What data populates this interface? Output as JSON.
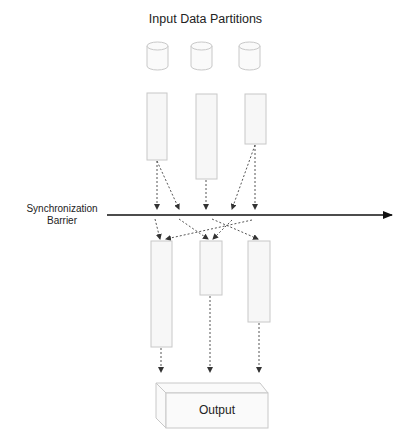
{
  "diagram": {
    "title": "Input Data Partitions",
    "barrier_label_line1": "Synchronization",
    "barrier_label_line2": "Barrier",
    "output_label": "Output",
    "colors": {
      "shape_stroke": "#c8c8c8",
      "shape_fill": "#f7f7f7",
      "arrow": "#555555",
      "barrier": "#111111",
      "text": "#222222"
    },
    "input_partitions": [
      {
        "id": "db-1",
        "x": 147,
        "y": 40
      },
      {
        "id": "db-2",
        "x": 191,
        "y": 40
      },
      {
        "id": "db-3",
        "x": 239,
        "y": 40
      }
    ],
    "map_tasks": [
      {
        "id": "map-1",
        "x": 147,
        "y": 93,
        "w": 20,
        "h": 67
      },
      {
        "id": "map-2",
        "x": 196,
        "y": 94,
        "w": 21,
        "h": 85
      },
      {
        "id": "map-3",
        "x": 245,
        "y": 94,
        "w": 21,
        "h": 50
      }
    ],
    "reduce_tasks": [
      {
        "id": "reduce-1",
        "x": 151,
        "y": 241,
        "w": 21,
        "h": 106
      },
      {
        "id": "reduce-2",
        "x": 200,
        "y": 241,
        "w": 22,
        "h": 54
      },
      {
        "id": "reduce-3",
        "x": 248,
        "y": 241,
        "w": 22,
        "h": 81
      }
    ]
  }
}
